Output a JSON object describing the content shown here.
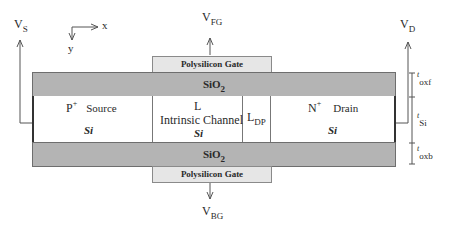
{
  "terminals": {
    "source": {
      "main": "V",
      "sub": "S"
    },
    "drain": {
      "main": "V",
      "sub": "D"
    },
    "front_gate": {
      "main": "V",
      "sub": "FG"
    },
    "back_gate": {
      "main": "V",
      "sub": "BG"
    }
  },
  "axes": {
    "x": "x",
    "y": "y"
  },
  "gates": {
    "front": "Polysilicon Gate",
    "back": "Polysilicon Gate"
  },
  "oxide": {
    "front": {
      "main": "SiO",
      "sub": "2"
    },
    "back": {
      "main": "SiO",
      "sub": "2"
    }
  },
  "regions": {
    "source": {
      "dopant": "P",
      "dopant_sup": "+",
      "name": "Source",
      "material": "Si"
    },
    "channel": {
      "length": "L",
      "name": "Intrinsic Channel",
      "material": "Si"
    },
    "depletion": {
      "main": "L",
      "sub": "DP"
    },
    "drain": {
      "dopant": "N",
      "dopant_sup": "+",
      "name": "Drain",
      "material": "Si"
    }
  },
  "thickness": {
    "front_oxide": {
      "main": "t",
      "sub": "oxf"
    },
    "silicon": {
      "main": "t",
      "sub": "Si"
    },
    "back_oxide": {
      "main": "t",
      "sub": "oxb"
    }
  }
}
